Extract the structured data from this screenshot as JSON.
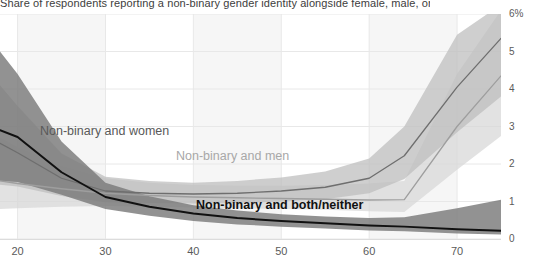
{
  "title": "Share of respondents reporting a non-binary gender identity alongside female, male, or both/neither (%) by age",
  "axes": {
    "y_ticks": [
      "6%",
      "5",
      "4",
      "3",
      "2",
      "1",
      "0"
    ],
    "x_ticks": [
      "20",
      "30",
      "40",
      "50",
      "60",
      "70"
    ],
    "ylabel": "",
    "xlabel": ""
  },
  "labels": {
    "women": "Non-binary and women",
    "men": "Non-binary and men",
    "both": "Non-binary and both/neither"
  },
  "colors": {
    "women_line": "#6e6e6e",
    "men_line": "#9e9e9e",
    "both_line": "#111111",
    "women_band": "#bdbdbd",
    "men_band": "#d7d7d7",
    "both_band": "#7a7a7a",
    "gridline": "#e8e8e8",
    "band_stripe": "#f6f6f6",
    "tick_text": "#5a5a5a",
    "title_text": "#3d3d3d"
  },
  "chart_data": {
    "type": "line",
    "title": "Share of respondents reporting a non-binary gender identity alongside female, male, or both/neither (%) by age",
    "xlabel": "Age",
    "ylabel": "Percent",
    "xlim": [
      18,
      75
    ],
    "ylim": [
      0,
      6
    ],
    "grid": true,
    "legend": "inline-annotations",
    "x": [
      18,
      20,
      25,
      30,
      35,
      40,
      45,
      50,
      55,
      60,
      64,
      70,
      75
    ],
    "series": [
      {
        "name": "Non-binary and women",
        "color": "#6e6e6e",
        "values": [
          2.55,
          2.3,
          1.62,
          1.28,
          1.22,
          1.2,
          1.22,
          1.28,
          1.38,
          1.62,
          2.22,
          4.05,
          5.35
        ],
        "band_lower": [
          1.45,
          1.4,
          1.15,
          0.98,
          0.96,
          0.95,
          0.96,
          1.0,
          1.06,
          1.22,
          1.6,
          2.85,
          3.8
        ],
        "band_upper": [
          4.1,
          3.55,
          2.28,
          1.66,
          1.55,
          1.5,
          1.55,
          1.64,
          1.8,
          2.15,
          3.0,
          5.45,
          6.25
        ]
      },
      {
        "name": "Non-binary and men",
        "color": "#9e9e9e",
        "values": [
          1.55,
          1.48,
          1.34,
          1.22,
          1.16,
          1.12,
          1.1,
          1.08,
          1.06,
          1.04,
          1.05,
          3.0,
          4.35
        ],
        "band_lower": [
          0.8,
          0.82,
          0.86,
          0.88,
          0.86,
          0.84,
          0.82,
          0.8,
          0.78,
          0.74,
          0.72,
          1.85,
          2.75
        ],
        "band_upper": [
          2.7,
          2.45,
          1.95,
          1.62,
          1.5,
          1.44,
          1.42,
          1.42,
          1.44,
          1.48,
          1.55,
          4.4,
          6.1
        ]
      },
      {
        "name": "Non-binary and both/neither",
        "color": "#111111",
        "values": [
          2.9,
          2.72,
          1.78,
          1.12,
          0.86,
          0.68,
          0.56,
          0.48,
          0.42,
          0.36,
          0.33,
          0.26,
          0.22
        ],
        "band_lower": [
          1.55,
          1.52,
          1.18,
          0.8,
          0.62,
          0.48,
          0.39,
          0.33,
          0.28,
          0.23,
          0.21,
          0.15,
          0.12
        ],
        "band_upper": [
          5.0,
          4.4,
          2.6,
          1.5,
          1.14,
          0.9,
          0.76,
          0.66,
          0.6,
          0.56,
          0.58,
          0.82,
          1.05
        ]
      }
    ]
  }
}
